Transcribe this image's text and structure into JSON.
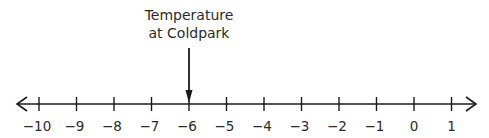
{
  "annotation": {
    "line1": "Temperature",
    "line2": "at Coldpark",
    "points_to": -6
  },
  "number_line": {
    "min": -10,
    "max": 1,
    "step": 1,
    "ticks": [
      "−10",
      "−9",
      "−8",
      "−7",
      "−6",
      "−5",
      "−4",
      "−3",
      "−2",
      "−1",
      "0",
      "1"
    ],
    "arrows": "both",
    "color": "#1a1a1a"
  }
}
